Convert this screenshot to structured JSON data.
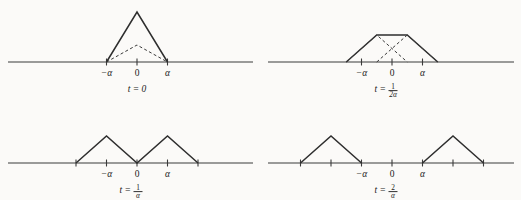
{
  "figure": {
    "title": "",
    "background": "#fbfaf8",
    "stroke_color": "#2e2e2e",
    "axis_color": "#3a3a3a"
  },
  "chart_data": {
    "type": "line",
    "xlabel": "",
    "ylabel": "",
    "grid": false,
    "legend": "none",
    "panels": [
      {
        "id": "panel-t0",
        "caption": "t = 0",
        "caption_t": "t",
        "caption_eq": "=",
        "caption_value": "0",
        "caption_is_fraction": false,
        "axis": {
          "x_min_units": -3.4,
          "x_max_units": 3.4
        },
        "ticks": [
          {
            "x_units": -1,
            "label": "−α",
            "italic": true
          },
          {
            "x_units": 0,
            "label": "0",
            "italic": false
          },
          {
            "x_units": 1,
            "label": "α",
            "italic": true
          }
        ],
        "series": [
          {
            "name": "solid-triangle",
            "style": "solid",
            "points_units": [
              [
                -1,
                0
              ],
              [
                0,
                1
              ],
              [
                1,
                0
              ]
            ]
          },
          {
            "name": "dashed-triangle",
            "style": "dashed",
            "points_units": [
              [
                -1,
                0
              ],
              [
                0,
                0.34
              ],
              [
                1,
                0
              ]
            ]
          }
        ]
      },
      {
        "id": "panel-t-1-over-2alpha",
        "caption": "t = 1/2α",
        "caption_t": "t",
        "caption_eq": "=",
        "caption_is_fraction": true,
        "caption_numerator": "1",
        "caption_denominator": "2α",
        "axis": {
          "x_min_units": -3.4,
          "x_max_units": 3.4
        },
        "ticks": [
          {
            "x_units": -1,
            "label": "−α",
            "italic": true
          },
          {
            "x_units": 0,
            "label": "0",
            "italic": false
          },
          {
            "x_units": 1,
            "label": "α",
            "italic": true
          }
        ],
        "series": [
          {
            "name": "trapezoid",
            "style": "solid",
            "points_units": [
              [
                -1.5,
                0
              ],
              [
                -0.5,
                0.54
              ],
              [
                0.5,
                0.54
              ],
              [
                1.5,
                0
              ]
            ]
          },
          {
            "name": "dashed-triangle-left",
            "style": "dashed",
            "points_units": [
              [
                -1.5,
                0
              ],
              [
                -0.5,
                0.54
              ],
              [
                0.5,
                0
              ]
            ]
          },
          {
            "name": "dashed-triangle-right",
            "style": "dashed",
            "points_units": [
              [
                -0.5,
                0
              ],
              [
                0.5,
                0.54
              ],
              [
                1.5,
                0
              ]
            ]
          }
        ]
      },
      {
        "id": "panel-t-1-over-alpha",
        "caption": "t = 1/α",
        "caption_t": "t",
        "caption_eq": "=",
        "caption_is_fraction": true,
        "caption_numerator": "1",
        "caption_denominator": "α",
        "axis": {
          "x_min_units": -3.4,
          "x_max_units": 3.4
        },
        "ticks": [
          {
            "x_units": -2,
            "label": "",
            "italic": false
          },
          {
            "x_units": -1,
            "label": "−α",
            "italic": true
          },
          {
            "x_units": 0,
            "label": "0",
            "italic": false
          },
          {
            "x_units": 1,
            "label": "α",
            "italic": true
          },
          {
            "x_units": 2,
            "label": "",
            "italic": false
          }
        ],
        "series": [
          {
            "name": "double-triangle",
            "style": "solid",
            "points_units": [
              [
                -2,
                0
              ],
              [
                -1,
                0.54
              ],
              [
                0,
                0
              ],
              [
                1,
                0.54
              ],
              [
                2,
                0
              ]
            ]
          }
        ]
      },
      {
        "id": "panel-t-2-over-alpha",
        "caption": "t = 2/α",
        "caption_t": "t",
        "caption_eq": "=",
        "caption_is_fraction": true,
        "caption_numerator": "2",
        "caption_denominator": "α",
        "axis": {
          "x_min_units": -3.4,
          "x_max_units": 3.4
        },
        "ticks": [
          {
            "x_units": -3,
            "label": "",
            "italic": false
          },
          {
            "x_units": -2,
            "label": "",
            "italic": false
          },
          {
            "x_units": -1,
            "label": "−α",
            "italic": true
          },
          {
            "x_units": 0,
            "label": "0",
            "italic": false
          },
          {
            "x_units": 1,
            "label": "α",
            "italic": true
          },
          {
            "x_units": 2,
            "label": "",
            "italic": false
          },
          {
            "x_units": 3,
            "label": "",
            "italic": false
          }
        ],
        "series": [
          {
            "name": "left-triangle",
            "style": "solid",
            "points_units": [
              [
                -3,
                0
              ],
              [
                -2,
                0.54
              ],
              [
                -1,
                0
              ]
            ]
          },
          {
            "name": "right-triangle",
            "style": "solid",
            "points_units": [
              [
                1,
                0
              ],
              [
                2,
                0.54
              ],
              [
                3,
                0
              ]
            ]
          }
        ]
      }
    ]
  }
}
